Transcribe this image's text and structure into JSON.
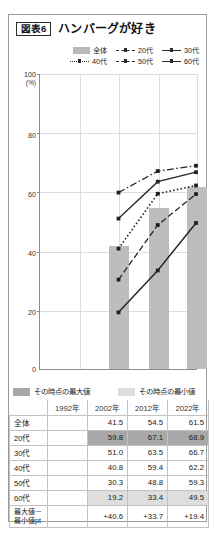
{
  "header": {
    "figure_tag": "図表6",
    "title": "ハンバーグが好き"
  },
  "legend": {
    "rows": [
      [
        {
          "label": "全体",
          "style": "bar"
        },
        {
          "label": "20代",
          "style": "dash-dot"
        },
        {
          "label": "30代",
          "style": "solid"
        }
      ],
      [
        {
          "label": "40代",
          "style": "dotted"
        },
        {
          "label": "50代",
          "style": "dash"
        },
        {
          "label": "60代",
          "style": "solid-thick"
        }
      ]
    ]
  },
  "axis": {
    "y_top_label": "100",
    "y_unit": "(%)",
    "ticks": [
      "80",
      "60",
      "40",
      "20",
      "0"
    ],
    "ymin": 0,
    "ymax": 100
  },
  "minmax_legend": {
    "max_label": "その時点の最大値",
    "min_label": "その時点の最小値",
    "max_color": "#a8a8a8",
    "min_color": "#dedede"
  },
  "table": {
    "columns": [
      "",
      "1992年",
      "2002年",
      "2012年",
      "2022年"
    ],
    "rows": [
      {
        "label": "全体",
        "values": [
          "",
          "41.5",
          "54.5",
          "61.5"
        ],
        "marks": [
          "",
          "",
          "",
          ""
        ]
      },
      {
        "label": "20代",
        "values": [
          "",
          "59.8",
          "67.1",
          "68.9"
        ],
        "marks": [
          "",
          "hi",
          "hi",
          "hi"
        ]
      },
      {
        "label": "30代",
        "values": [
          "",
          "51.0",
          "63.5",
          "66.7"
        ],
        "marks": [
          "",
          "",
          "",
          ""
        ]
      },
      {
        "label": "40代",
        "values": [
          "",
          "40.8",
          "59.4",
          "62.2"
        ],
        "marks": [
          "",
          "",
          "",
          ""
        ]
      },
      {
        "label": "50代",
        "values": [
          "",
          "30.3",
          "48.8",
          "59.3"
        ],
        "marks": [
          "",
          "",
          "",
          ""
        ]
      },
      {
        "label": "60代",
        "values": [
          "",
          "19.2",
          "33.4",
          "49.5"
        ],
        "marks": [
          "",
          "lo",
          "lo",
          "lo"
        ]
      },
      {
        "label": "最大値－\n最小値pt",
        "values": [
          "",
          "+40.6",
          "+33.7",
          "+19.4"
        ],
        "marks": [
          "",
          "",
          "",
          ""
        ]
      }
    ]
  },
  "chart_data": {
    "type": "line",
    "title": "ハンバーグが好き",
    "xlabel": "",
    "ylabel": "(%)",
    "ylim": [
      0,
      100
    ],
    "grid": true,
    "legend_position": "top-right",
    "categories": [
      "1992年",
      "2002年",
      "2012年",
      "2022年"
    ],
    "bars": {
      "name": "全体",
      "color": "#bdbdbd",
      "values": [
        null,
        41.5,
        54.5,
        61.5
      ]
    },
    "series": [
      {
        "name": "20代",
        "style": "dash-dot",
        "values": [
          null,
          59.8,
          67.1,
          68.9
        ]
      },
      {
        "name": "30代",
        "style": "solid",
        "values": [
          null,
          51.0,
          63.5,
          66.7
        ]
      },
      {
        "name": "40代",
        "style": "dotted",
        "values": [
          null,
          40.8,
          59.4,
          62.2
        ]
      },
      {
        "name": "50代",
        "style": "dash",
        "values": [
          null,
          30.3,
          48.8,
          59.3
        ]
      },
      {
        "name": "60代",
        "style": "solid-thick",
        "values": [
          null,
          19.2,
          33.4,
          49.5
        ]
      }
    ]
  }
}
